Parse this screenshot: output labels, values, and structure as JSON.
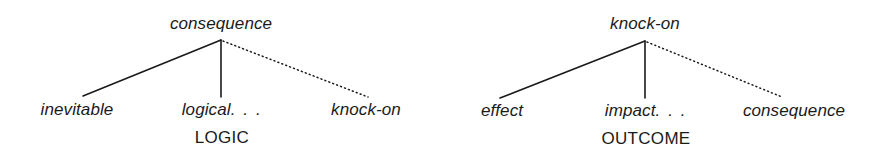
{
  "figure": {
    "background_color": "#ffffff",
    "ink_color": "#1a1a1a",
    "width": 874,
    "height": 164
  },
  "diagrams": [
    {
      "id": "logic",
      "sense_label": "LOGIC",
      "root": {
        "text": "consequence",
        "x": 221,
        "y": 26
      },
      "apex": {
        "x": 221,
        "y": 40
      },
      "leaves": [
        {
          "text": "inevitable",
          "x": 77,
          "y": 112,
          "edge": {
            "style": "solid",
            "end_x": 83,
            "end_y": 96
          }
        },
        {
          "text": "logical",
          "ellipsis": ". . .",
          "x": 222,
          "y": 112,
          "edge": {
            "style": "solid",
            "end_x": 221,
            "end_y": 97
          }
        },
        {
          "text": "knock-on",
          "x": 366,
          "y": 112,
          "edge": {
            "style": "dotted",
            "end_x": 368,
            "end_y": 97
          }
        }
      ],
      "sense_x": 222,
      "sense_y": 138
    },
    {
      "id": "outcome",
      "sense_label": "OUTCOME",
      "root": {
        "text": "knock-on",
        "x": 208,
        "y": 26
      },
      "apex": {
        "x": 208,
        "y": 41
      },
      "leaves": [
        {
          "text": "effect",
          "x": 65,
          "y": 113,
          "edge": {
            "style": "solid",
            "end_x": 63,
            "end_y": 98
          }
        },
        {
          "text": "impact",
          "ellipsis": ". . .",
          "x": 209,
          "y": 113,
          "edge": {
            "style": "solid",
            "end_x": 208,
            "end_y": 98
          }
        },
        {
          "text": "consequence",
          "x": 357,
          "y": 113,
          "edge": {
            "style": "dotted",
            "end_x": 345,
            "end_y": 97
          }
        }
      ],
      "sense_x": 209,
      "sense_y": 139
    }
  ]
}
